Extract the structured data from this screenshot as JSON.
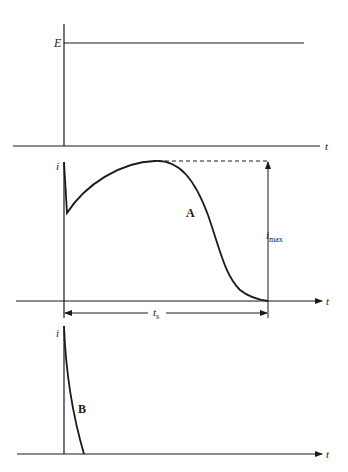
{
  "panel_top": {
    "voltage_label": "E",
    "time_label": "t"
  },
  "panel_middle": {
    "current_label": "i",
    "time_label": "t",
    "curve_label": "A",
    "imax_label": "i",
    "imax_sub": "max",
    "ts_label": "t",
    "ts_sub": "s"
  },
  "panel_bottom": {
    "current_label": "i",
    "time_label": "t",
    "curve_label": "B"
  },
  "colors": {
    "ink": "#1a1a1a",
    "background": "#ffffff"
  }
}
